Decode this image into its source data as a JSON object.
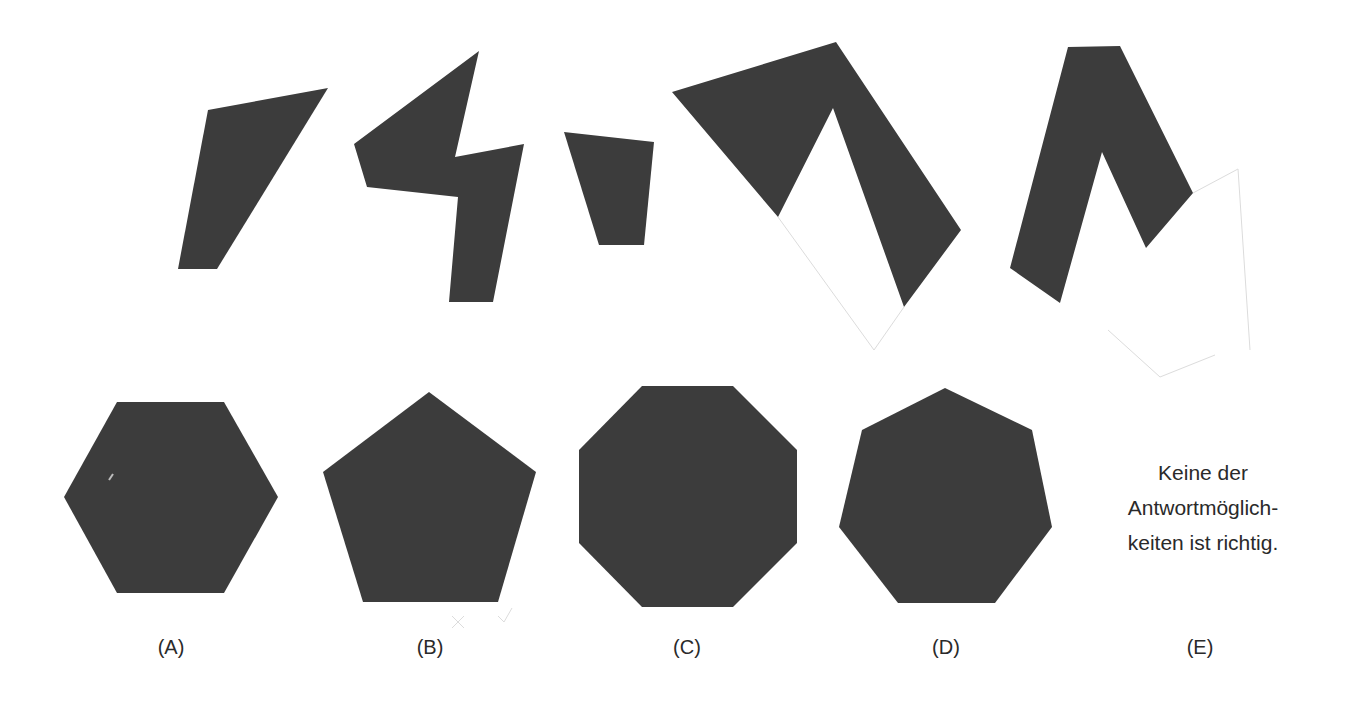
{
  "colors": {
    "shape_fill": "#3c3c3c",
    "pencil": "#dcdcdc",
    "text": "#2a2a2a",
    "background": "#ffffff"
  },
  "puzzle": {
    "pieces": [
      {
        "id": "piece-1",
        "points": "208,110 328,88 217,269 178,269"
      },
      {
        "id": "piece-2",
        "points": "479,51 455,157 524,144 493,302 449,302 458,197 367,187 354,144"
      },
      {
        "id": "piece-3",
        "points": "564,132 654,142 644,245 599,245"
      },
      {
        "id": "piece-4",
        "points": "672,92 836,42 961,230 904,307 833,108 778,217"
      },
      {
        "id": "piece-5",
        "points": "1068,47 1120,46 1193,193 1146,248 1102,152 1060,303 1010,268"
      }
    ],
    "pencil_marks": [
      "778,217 874,350 904,307",
      "1193,193 1238,169 1250,350",
      "1108,330 1160,377 1215,355",
      "452,616 464,628",
      "464,616 452,628",
      "498,616 504,622 512,608"
    ]
  },
  "options": [
    {
      "letter": "A",
      "label": "(A)",
      "shape": "hexagon",
      "label_x": 171,
      "points": "117,402 224,402 278,497 224,593 117,593 64,497"
    },
    {
      "letter": "B",
      "label": "(B)",
      "shape": "pentagon",
      "label_x": 430,
      "points": "429,392 536,472 498,602 363,602 323,472"
    },
    {
      "letter": "C",
      "label": "(C)",
      "shape": "octagon",
      "label_x": 687,
      "points": "642,386 733,386 797,450 797,543 733,607 642,607 579,543 579,450"
    },
    {
      "letter": "D",
      "label": "(D)",
      "shape": "heptagon",
      "label_x": 946,
      "points": "945,388 1032,430 1052,527 995,603 898,603 839,527 862,430"
    },
    {
      "letter": "E",
      "label": "(E)",
      "shape": "none",
      "label_x": 1200,
      "text_lines": [
        "Keine der",
        "Antwortmöglich-",
        "keiten ist richtig."
      ]
    }
  ]
}
